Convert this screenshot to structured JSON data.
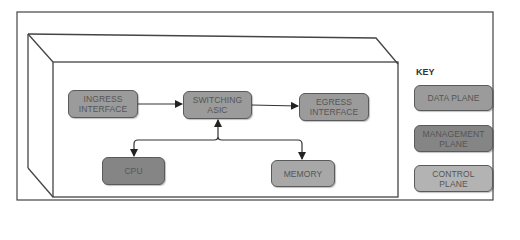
{
  "diagram": {
    "nodes": {
      "ingress": {
        "label": "INGRESS\nINTERFACE",
        "plane": "data"
      },
      "switching": {
        "label": "SWITCHING\nASIC",
        "plane": "data"
      },
      "egress": {
        "label": "EGRESS\nINTERFACE",
        "plane": "data"
      },
      "cpu": {
        "label": "CPU",
        "plane": "management"
      },
      "memory": {
        "label": "MEMORY",
        "plane": "data"
      }
    },
    "edges": [
      {
        "from": "ingress",
        "to": "switching",
        "direction": "forward"
      },
      {
        "from": "switching",
        "to": "egress",
        "direction": "forward"
      },
      {
        "from": "switching",
        "to": "cpu",
        "direction": "bidirectional"
      },
      {
        "from": "switching",
        "to": "memory",
        "direction": "bidirectional"
      }
    ]
  },
  "key": {
    "title": "KEY",
    "items": [
      {
        "label": "DATA PLANE",
        "color": "#9b9b9b"
      },
      {
        "label": "MANAGEMENT\nPLANE",
        "color": "#858585"
      },
      {
        "label": "CONTROL\nPLANE",
        "color": "#b3b3b3"
      }
    ]
  },
  "colors": {
    "data_plane": "#9b9b9b",
    "management_plane": "#858585",
    "control_plane": "#b3b3b3",
    "line": "#333333"
  }
}
